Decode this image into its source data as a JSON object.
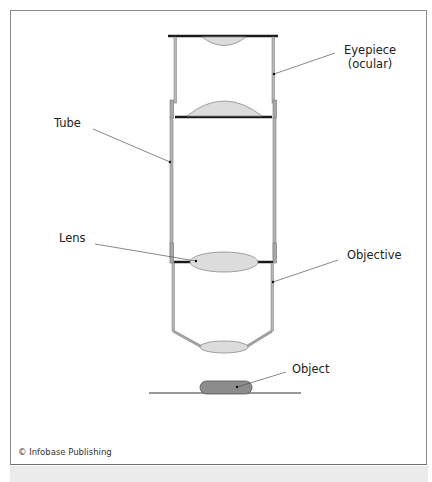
{
  "figure": {
    "type": "labeled-diagram",
    "labels": {
      "eyepiece_line1": "Eyepiece",
      "eyepiece_line2": "(ocular)",
      "tube": "Tube",
      "lens": "Lens",
      "objective": "Objective",
      "object": "Object"
    },
    "credit": "© Infobase Publishing",
    "colors": {
      "lens_fill": "#dcdcdc",
      "object_fill": "#8c8c8c",
      "tube_stroke": "#9a9a9a",
      "bar_stroke": "#1a1a1a",
      "leader_line": "#555555",
      "frame_border": "#8a8a8a"
    }
  }
}
